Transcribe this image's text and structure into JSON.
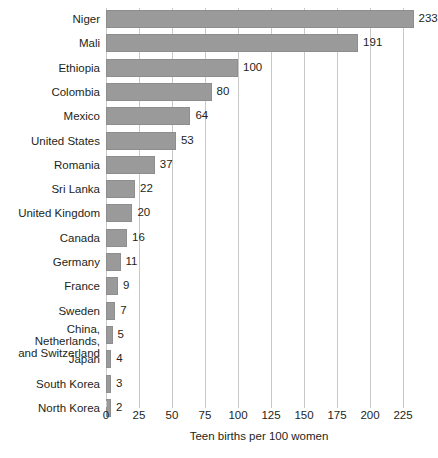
{
  "chart_data": {
    "type": "bar",
    "orientation": "horizontal",
    "title": "",
    "xlabel": "Teen births per 100 women",
    "ylabel": "",
    "xlim": [
      0,
      233
    ],
    "xticks": [
      0,
      25,
      50,
      75,
      100,
      125,
      150,
      175,
      200,
      225
    ],
    "grid": "vertical",
    "legend": "none",
    "bar_color": "#9a9a9a",
    "gridline_color": "#c9c9c9",
    "text_color": "#231f20",
    "categories": [
      "Niger",
      "Mali",
      "Ethiopia",
      "Colombia",
      "Mexico",
      "United States",
      "Romania",
      "Sri Lanka",
      "United Kingdom",
      "Canada",
      "Germany",
      "France",
      "Sweden",
      "China, Netherlands,\nand Switzerland",
      "Japan",
      "South Korea",
      "North Korea"
    ],
    "values": [
      233,
      191,
      100,
      80,
      64,
      53,
      37,
      22,
      20,
      16,
      11,
      9,
      7,
      5,
      4,
      3,
      2
    ],
    "value_labels": [
      "233",
      "191",
      "100",
      "80",
      "64",
      "53",
      "37",
      "22",
      "20",
      "16",
      "11",
      "9",
      "7",
      "5",
      "4",
      "3",
      "2"
    ]
  },
  "figure": {
    "caption": ""
  }
}
